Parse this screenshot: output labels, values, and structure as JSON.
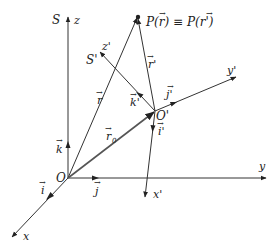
{
  "diagram": {
    "frames": {
      "S": {
        "label": "S",
        "origin": "O",
        "axes": {
          "x": "x",
          "y": "y",
          "z": "z"
        },
        "unit_vectors": {
          "i": "i",
          "j": "j",
          "k": "k"
        }
      },
      "S_prime": {
        "label": "S'",
        "origin": "O'",
        "axes": {
          "x": "x'",
          "y": "y'",
          "z": "z'"
        },
        "unit_vectors": {
          "i": "i'",
          "j": "j'",
          "k": "k'"
        }
      }
    },
    "vectors": {
      "r": "r",
      "r_prime": "r'",
      "r0": "r",
      "r0_sub": "0"
    },
    "point_label": "P(r) ≡ P(r')",
    "point_label_parts": {
      "p1": "P(",
      "r": "r",
      "mid": ") ≡ P(",
      "r2": "r",
      "prime": "'",
      "end": ")"
    },
    "arrow_glyph": "→",
    "colors": {
      "line": "#333333",
      "r0_line": "#555555",
      "text": "#222222",
      "background": "#ffffff"
    }
  }
}
